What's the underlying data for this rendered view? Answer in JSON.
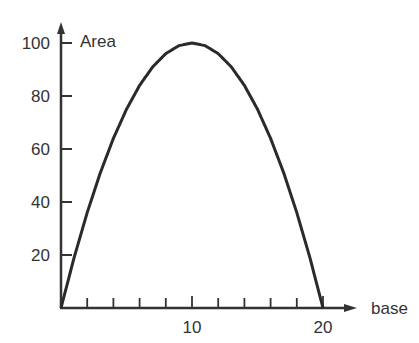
{
  "chart_data": {
    "type": "line",
    "title": "",
    "xlabel": "base",
    "ylabel": "Area",
    "xlim": [
      0,
      20
    ],
    "ylim": [
      0,
      100
    ],
    "x_tick_labels": [
      "10",
      "20"
    ],
    "x_minor_ticks": [
      2,
      4,
      6,
      8,
      10,
      12,
      14,
      16,
      18,
      20
    ],
    "y_tick_labels": [
      "20",
      "40",
      "60",
      "80",
      "100"
    ],
    "grid": false,
    "legend": null,
    "series": [
      {
        "name": "Area",
        "function": "Area = base * (20 - base)",
        "x": [
          0,
          1,
          2,
          3,
          4,
          5,
          6,
          7,
          8,
          9,
          10,
          11,
          12,
          13,
          14,
          15,
          16,
          17,
          18,
          19,
          20
        ],
        "values": [
          0,
          19,
          36,
          51,
          64,
          75,
          84,
          91,
          96,
          99,
          100,
          99,
          96,
          91,
          84,
          75,
          64,
          51,
          36,
          19,
          0
        ]
      }
    ]
  }
}
